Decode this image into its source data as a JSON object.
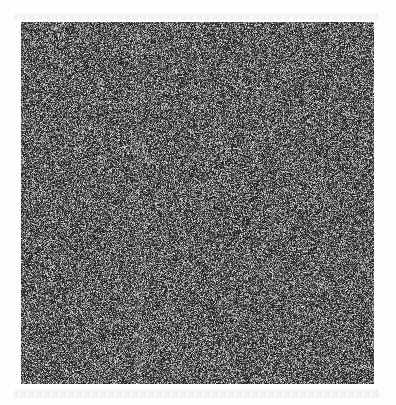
{
  "image": {
    "description": "Square of random grayscale noise on a white background",
    "square": {
      "x": 21,
      "y": 22,
      "width": 353,
      "height": 362
    },
    "colors": {
      "background": "#fdfdfd",
      "noise_base": "#3c3c3c",
      "noise_dark": "#1a1a1a",
      "noise_light": "#b0b0b0"
    }
  }
}
